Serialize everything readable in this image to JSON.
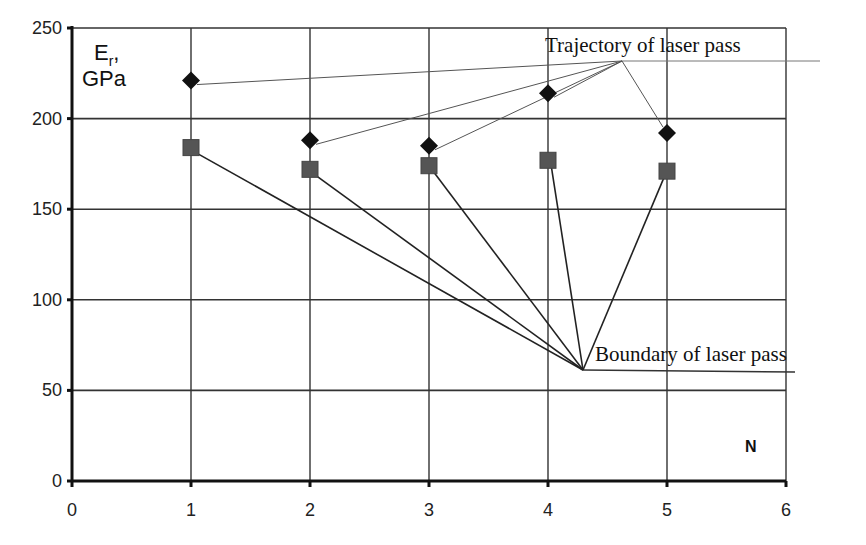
{
  "chart_data": {
    "type": "scatter",
    "title": "",
    "xlabel": "N",
    "ylabel": "Er, GPa",
    "ylabel_main": "E",
    "ylabel_sub": "r",
    "ylabel_suffix": ",",
    "ylabel_unit": "GPa",
    "xlim": [
      0,
      6
    ],
    "ylim": [
      0,
      250
    ],
    "x_ticks": [
      0,
      1,
      2,
      3,
      4,
      5,
      6
    ],
    "y_ticks": [
      0,
      50,
      100,
      150,
      200,
      250
    ],
    "grid": true,
    "legend": null,
    "x": [
      1,
      2,
      3,
      4,
      5
    ],
    "series": [
      {
        "name": "Trajectory of laser pass",
        "marker": "diamond",
        "color": "#111111",
        "values": [
          221,
          188,
          185,
          214,
          192
        ]
      },
      {
        "name": "Boundary of laser pass",
        "marker": "square",
        "color": "#555555",
        "values": [
          184,
          172,
          174,
          177,
          171
        ]
      }
    ],
    "annotations": [
      {
        "text": "Trajectory of laser pass",
        "points_to_series": 0,
        "anchor": [
          4.6,
          232
        ]
      },
      {
        "text": "Boundary of laser pass",
        "points_to_series": 1,
        "anchor": [
          4.3,
          61
        ]
      }
    ]
  }
}
